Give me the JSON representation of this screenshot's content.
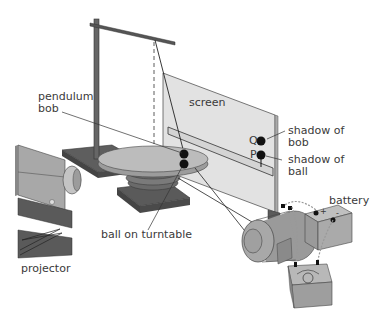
{
  "diagram": {
    "labels": {
      "pendulum_bob_line1": "pendulum",
      "pendulum_bob_line2": "bob",
      "screen": "screen",
      "q": "Q",
      "p": "P",
      "shadow_of_bob_line1": "shadow of",
      "shadow_of_bob_line2": "bob",
      "shadow_of_ball_line1": "shadow of",
      "shadow_of_ball_line2": "ball",
      "ball_on_turntable": "ball on turntable",
      "battery": "battery",
      "battery_plus": "+",
      "battery_minus": "-",
      "projector": "projector"
    },
    "components": [
      "retort stand",
      "pendulum",
      "screen",
      "turntable",
      "projector",
      "motor",
      "battery",
      "variable resistor"
    ],
    "colors": {
      "light_grey": "#c8c8c8",
      "mid_grey": "#9a9a9a",
      "dark_grey": "#5a5a5a",
      "screen": "#e2e2e2",
      "ink": "#1a1a1a"
    }
  }
}
